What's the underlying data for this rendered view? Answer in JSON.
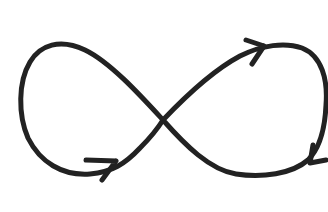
{
  "diagram": {
    "type": "infinity-loop",
    "stroke_color": "#222222",
    "background_color": "#ffffff",
    "stroke_width": 5,
    "arrows": [
      {
        "name": "left-loop-bottom-arrow",
        "direction": "right"
      },
      {
        "name": "right-loop-top-arrow",
        "direction": "right"
      },
      {
        "name": "right-loop-side-arrow",
        "direction": "down-left"
      }
    ]
  }
}
